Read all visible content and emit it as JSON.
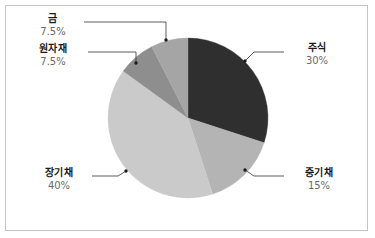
{
  "chart_data": {
    "type": "pie",
    "title": "",
    "subtitle": "",
    "legend_position": "callout-labels",
    "grid": false,
    "start_angle_deg": 0,
    "direction": "clockwise",
    "categories": [
      "주식",
      "중기채",
      "장기채",
      "원자재",
      "금"
    ],
    "values": [
      30,
      15,
      40,
      7.5,
      7.5
    ],
    "value_labels": [
      "30%",
      "15%",
      "40%",
      "7.5%",
      "7.5%"
    ],
    "unit": "%",
    "total": 100,
    "slices": [
      {
        "name": "주식",
        "value": 30,
        "value_label": "30%",
        "color": "#2f2f2f",
        "start_deg": 0,
        "end_deg": 108,
        "label_side": "right"
      },
      {
        "name": "중기채",
        "value": 15,
        "value_label": "15%",
        "color": "#b4b4b4",
        "start_deg": 108,
        "end_deg": 162,
        "label_side": "right"
      },
      {
        "name": "장기채",
        "value": 40,
        "value_label": "40%",
        "color": "#cacaca",
        "start_deg": 162,
        "end_deg": 306,
        "label_side": "left"
      },
      {
        "name": "원자재",
        "value": 7.5,
        "value_label": "7.5%",
        "color": "#8e8e8e",
        "start_deg": 306,
        "end_deg": 333,
        "label_side": "left"
      },
      {
        "name": "금",
        "value": 7.5,
        "value_label": "7.5%",
        "color": "#a5a5a5",
        "start_deg": 333,
        "end_deg": 360,
        "label_side": "left"
      }
    ],
    "colors": {
      "stock": "#2f2f2f",
      "midbond": "#b4b4b4",
      "longbond": "#cacaca",
      "commodity": "#8e8e8e",
      "gold": "#a5a5a5",
      "leader_line": "#4a4a4a",
      "frame_border": "#c4c4c4",
      "background": "#ffffff",
      "name_text": "#1a1a1a",
      "percent_text": "#6a6a6a"
    }
  },
  "labels": {
    "gold": {
      "name": "금",
      "percent": "7.5%"
    },
    "commodity": {
      "name": "원자재",
      "percent": "7.5%"
    },
    "longbond": {
      "name": "장기채",
      "percent": "40%"
    },
    "stock": {
      "name": "주식",
      "percent": "30%"
    },
    "midbond": {
      "name": "중기채",
      "percent": "15%"
    }
  }
}
